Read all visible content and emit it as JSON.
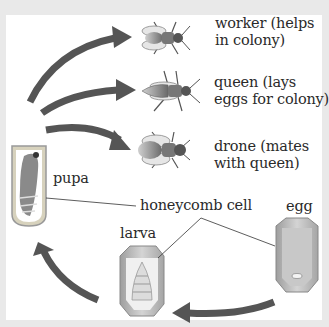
{
  "diagram": {
    "stages": [
      {
        "id": "worker",
        "label_line1": "worker  (helps",
        "label_line2": "in colony)"
      },
      {
        "id": "queen",
        "label_line1": "queen  (lays",
        "label_line2": "eggs for colony)"
      },
      {
        "id": "drone",
        "label_line1": "drone  (mates",
        "label_line2": "with queen)"
      },
      {
        "id": "pupa",
        "label": "pupa"
      },
      {
        "id": "larva",
        "label": "larva"
      },
      {
        "id": "egg",
        "label": "egg"
      }
    ],
    "shared_label": "honeycomb cell",
    "flow": [
      "egg",
      "larva",
      "pupa",
      "worker / queen / drone"
    ],
    "colors": {
      "arrow": "#555555",
      "background": "#ffffff",
      "frame": "#e9e9e9",
      "cell_fill": "#bdbdbd",
      "text": "#2a2a2a"
    }
  }
}
